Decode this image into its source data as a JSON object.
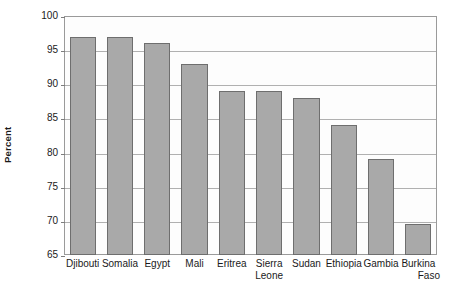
{
  "chart_data": {
    "type": "bar",
    "title": "",
    "xlabel": "",
    "ylabel": "Percent",
    "ylim": [
      65,
      100
    ],
    "ytick_step": 5,
    "yticks": [
      100,
      95,
      90,
      85,
      80,
      75,
      70,
      65
    ],
    "grid": true,
    "legend": "none",
    "orientation": "vertical",
    "categories": [
      "Djibouti",
      "Somalia",
      "Egypt",
      "Mali",
      "Eritrea",
      "Sierra Leone",
      "Sudan",
      "Ethiopia",
      "Gambia",
      "Burkina Faso"
    ],
    "category_lines": [
      [
        "Djibouti"
      ],
      [
        "Somalia"
      ],
      [
        "Egypt"
      ],
      [
        "Mali"
      ],
      [
        "Eritrea"
      ],
      [
        "Sierra",
        "Leone"
      ],
      [
        "Sudan"
      ],
      [
        "Ethiopia"
      ],
      [
        "Gambia"
      ],
      [
        "Burkina",
        "Faso"
      ]
    ],
    "values": [
      97,
      97,
      96,
      93,
      89,
      89,
      88,
      84,
      79,
      69.5
    ],
    "series": [
      {
        "name": "Percent",
        "values": [
          97,
          97,
          96,
          93,
          89,
          89,
          88,
          84,
          79,
          69.5
        ]
      }
    ]
  },
  "style": {
    "bar_fill": "#a9a9a9",
    "bar_stroke": "#6e6e6e",
    "gridline_color": "#b0b0b0",
    "frame_color": "#9a9a9a",
    "plot_background": "#fdfdfd",
    "page_background": "#ffffff",
    "text_color": "#1a1a1a"
  }
}
